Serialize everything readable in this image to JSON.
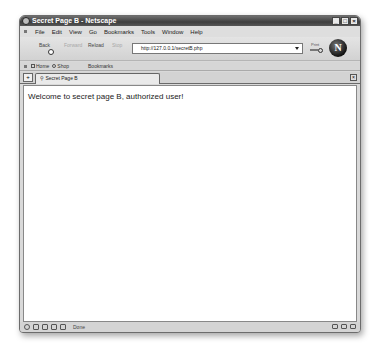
{
  "window": {
    "title": "Secret Page B - Netscape",
    "controls": {
      "minimize": "_",
      "maximize": "□",
      "close": "×"
    }
  },
  "menubar": {
    "items": [
      "File",
      "Edit",
      "View",
      "Go",
      "Bookmarks",
      "Tools",
      "Window",
      "Help"
    ]
  },
  "navbar": {
    "back": "Back",
    "forward": "Forward",
    "reload": "Reload",
    "stop": "Stop",
    "url": "http://127.0.0.1/secretB.php",
    "print": "Print",
    "logo": "N"
  },
  "bookmarkbar": {
    "items": [
      {
        "label": "Home",
        "icon": "home-icon"
      },
      {
        "label": "Shop",
        "icon": "shop-icon"
      },
      {
        "label": "Bookmarks",
        "icon": ""
      }
    ]
  },
  "tabs": [
    {
      "label": "Secret Page B",
      "active": true
    }
  ],
  "content": {
    "text": "Welcome to secret page B, authorized user!"
  },
  "statusbar": {
    "status": "Done"
  }
}
